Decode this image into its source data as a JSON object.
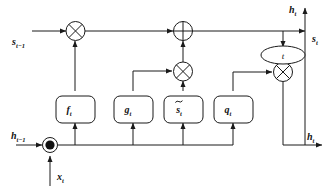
{
  "figure": {
    "type": "lstm-cell-diagram",
    "title": "",
    "background_color": "#ffffff",
    "line_color": "#1a1a1a"
  },
  "signals": {
    "state_in": {
      "base": "s",
      "sub": "t−1",
      "text": "s"
    },
    "state_out": {
      "base": "s",
      "sub": "t",
      "text": "s"
    },
    "hidden_in": {
      "base": "h",
      "sub": "t−1",
      "text": "h"
    },
    "hidden_out_top": {
      "base": "h",
      "sub": "t",
      "text": "h"
    },
    "hidden_out_bottom": {
      "base": "h",
      "sub": "t",
      "text": "h"
    },
    "input": {
      "base": "x",
      "sub": "t",
      "text": "x"
    }
  },
  "gates": [
    {
      "id": "forget-gate",
      "base": "f",
      "sub": "t",
      "tilde": false
    },
    {
      "id": "input-gate",
      "base": "g",
      "sub": "t",
      "tilde": false
    },
    {
      "id": "candidate-state",
      "base": "s",
      "sub": "t",
      "tilde": true
    },
    {
      "id": "output-gate",
      "base": "q",
      "sub": "t",
      "tilde": false
    }
  ],
  "operators": [
    {
      "id": "mult-forget",
      "symbol": "×",
      "kind": "multiply"
    },
    {
      "id": "add-state",
      "symbol": "+",
      "kind": "add"
    },
    {
      "id": "mult-input",
      "symbol": "×",
      "kind": "multiply"
    },
    {
      "id": "mult-output",
      "symbol": "×",
      "kind": "multiply"
    }
  ],
  "activation": {
    "id": "tanh-node",
    "label": "t"
  }
}
